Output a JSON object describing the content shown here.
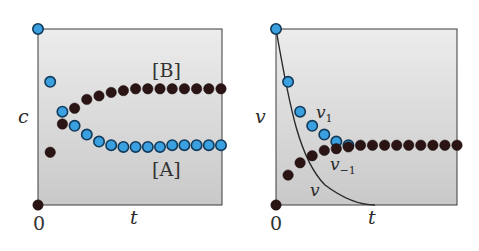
{
  "chart_data": [
    {
      "type": "scatter",
      "title": "",
      "xlabel": "t",
      "ylabel": "c",
      "origin_label": "0",
      "grid": false,
      "annotations": [
        "[B]",
        "[A]"
      ],
      "series": [
        {
          "name": "[A]",
          "color": "#3aa0e0",
          "x": [
            0,
            1,
            2,
            3,
            4,
            5,
            6,
            7,
            8,
            9,
            10,
            11,
            12,
            13,
            14,
            15
          ],
          "values": [
            1.0,
            0.7,
            0.53,
            0.45,
            0.4,
            0.36,
            0.34,
            0.33,
            0.33,
            0.33,
            0.33,
            0.34,
            0.34,
            0.34,
            0.34,
            0.34
          ]
        },
        {
          "name": "[B]",
          "color": "#2a1414",
          "x": [
            0,
            1,
            2,
            3,
            4,
            5,
            6,
            7,
            8,
            9,
            10,
            11,
            12,
            13,
            14,
            15
          ],
          "values": [
            0.0,
            0.3,
            0.46,
            0.55,
            0.6,
            0.62,
            0.64,
            0.65,
            0.66,
            0.66,
            0.66,
            0.66,
            0.66,
            0.66,
            0.66,
            0.66
          ]
        }
      ],
      "ylim": [
        0,
        1
      ],
      "xlim": [
        0,
        15
      ]
    },
    {
      "type": "scatter",
      "title": "",
      "xlabel": "t",
      "ylabel": "v",
      "origin_label": "0",
      "grid": false,
      "annotations": [
        "v₁",
        "v₋₁",
        "v"
      ],
      "series": [
        {
          "name": "v₁",
          "color": "#3aa0e0",
          "x": [
            0,
            1,
            2,
            3,
            4,
            5,
            6
          ],
          "values": [
            1.0,
            0.7,
            0.53,
            0.45,
            0.4,
            0.36,
            0.34
          ]
        },
        {
          "name": "v₋₁",
          "color": "#2a1414",
          "x": [
            0,
            1,
            2,
            3,
            4,
            5,
            6,
            7,
            8,
            9,
            10,
            11,
            12,
            13,
            14,
            15
          ],
          "values": [
            0.0,
            0.17,
            0.24,
            0.28,
            0.31,
            0.32,
            0.33,
            0.34,
            0.34,
            0.34,
            0.34,
            0.34,
            0.34,
            0.34,
            0.34,
            0.34
          ]
        },
        {
          "name": "v",
          "type": "line",
          "color": "#2a2a2a",
          "x": [
            0,
            1,
            2,
            3,
            4,
            5,
            6,
            7,
            8
          ],
          "values": [
            1.0,
            0.55,
            0.3,
            0.16,
            0.08,
            0.04,
            0.015,
            0.005,
            0.0
          ]
        }
      ],
      "ylim": [
        0,
        1
      ],
      "xlim": [
        0,
        15
      ]
    }
  ]
}
